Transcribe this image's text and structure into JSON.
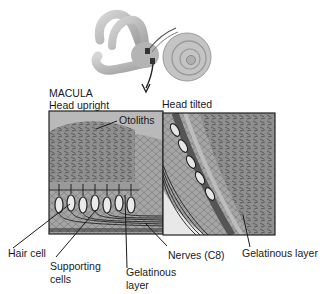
{
  "diagram": {
    "section_title": "MACULA",
    "panels": [
      {
        "id": "left",
        "label": "Head upright"
      },
      {
        "id": "right",
        "label": "Head tilted"
      }
    ],
    "labels": {
      "otoliths": "Otoliths",
      "hair_cell": "Hair cell",
      "supporting_cells_line1": "Supporting",
      "supporting_cells_line2": "cells",
      "gelatinous_left_line1": "Gelatinous",
      "gelatinous_left_line2": "layer",
      "nerves": "Nerves (C8)",
      "gelatinous_right": "Gelatinous layer"
    },
    "colors": {
      "line": "#1a1a1a",
      "tissue_dark": "#6e6e6e",
      "tissue_mid": "#9a9a9a",
      "tissue_light": "#c8c8c8",
      "labyrinth": "#b9b9b9"
    }
  }
}
